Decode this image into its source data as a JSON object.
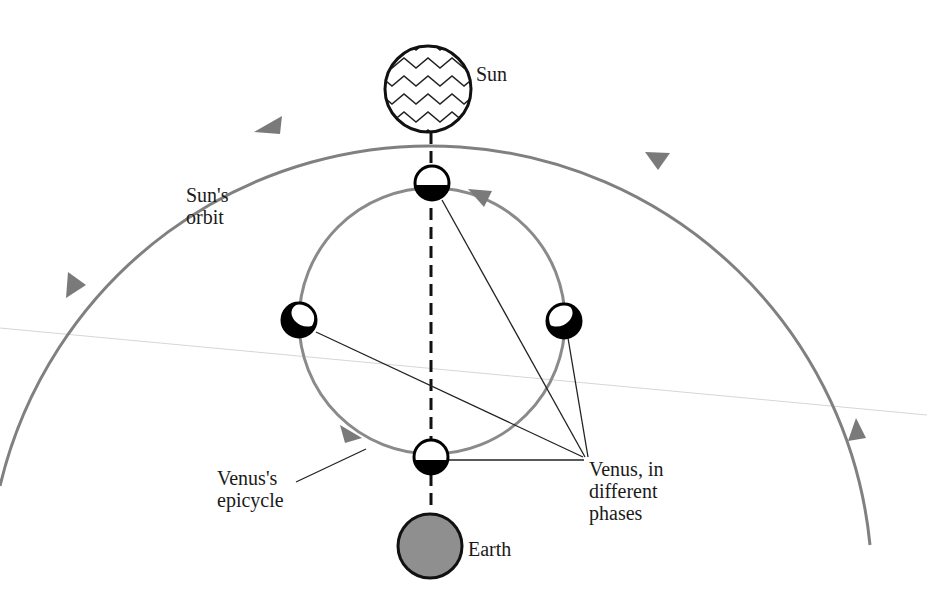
{
  "labels": {
    "sun": "Sun",
    "sun_orbit": "Sun's\norbit",
    "venus_epicycle": "Venus's\nepicycle",
    "venus_phases": "Venus, in\ndifferent\nphases",
    "earth": "Earth"
  },
  "colors": {
    "orbit": "#808080",
    "earth_fill": "#8f8f8f",
    "outline": "#111111",
    "faint_line": "#d0d0d0"
  },
  "bodies": {
    "sun": "Sun",
    "earth": "Earth",
    "venus_positions": [
      "top",
      "left",
      "right",
      "bottom"
    ]
  }
}
